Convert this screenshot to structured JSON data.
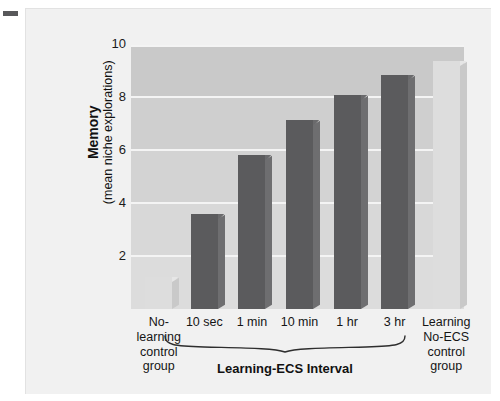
{
  "figure": {
    "panel_bg": "#f1f1f1",
    "corner_dash_color": "#58585a"
  },
  "chart_data": {
    "type": "bar",
    "title": "",
    "xlabel": "Learning-ECS Interval",
    "ylabel": "Memory (mean niche explorations)",
    "ylabel_main": "Memory",
    "ylabel_sub": "(mean niche explorations)",
    "ylim": [
      0,
      10.6
    ],
    "yticks": [
      2,
      4,
      6,
      8,
      10
    ],
    "ytick_labels": [
      "2",
      "4",
      "6",
      "8",
      "10"
    ],
    "grid": true,
    "legend": "none",
    "categories": [
      "No-\nlearning\ncontrol\ngroup",
      "10 sec",
      "1 min",
      "10 min",
      "1 hr",
      "3 hr",
      "Learning\nNo-ECS\ncontrol\ngroup"
    ],
    "category_labels": [
      [
        "No-",
        "learning",
        "control",
        "group"
      ],
      [
        "10 sec"
      ],
      [
        "1 min"
      ],
      [
        "10 min"
      ],
      [
        "1 hr"
      ],
      [
        "3 hr"
      ],
      [
        "Learning",
        "No-ECS",
        "control",
        "group"
      ]
    ],
    "values": [
      1.3,
      3.8,
      6.2,
      7.6,
      8.6,
      9.4,
      9.95
    ],
    "bar_styles": [
      "light",
      "dark",
      "dark",
      "dark",
      "dark",
      "dark",
      "light"
    ],
    "colors": {
      "dark_bar": "#5b5b5d",
      "light_bar": "#dddddd",
      "plot_bg": "#cfcfcf",
      "gridline": "#f4f4f4"
    },
    "group_bracket": {
      "label": "Learning-ECS Interval",
      "covers": [
        "10 sec",
        "1 min",
        "10 min",
        "1 hr",
        "3 hr"
      ]
    }
  }
}
